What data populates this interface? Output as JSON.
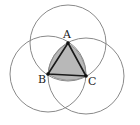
{
  "diagram": {
    "points": [
      {
        "label": "A",
        "x": 68,
        "y": 43
      },
      {
        "label": "B",
        "x": 48,
        "y": 74
      },
      {
        "label": "C",
        "x": 86,
        "y": 76
      }
    ],
    "radius": 38,
    "colors": {
      "circle_stroke": "#8a8a8a",
      "fill": "#b8b8b8",
      "triangle_stroke": "#1a1a1a",
      "point": "#111111"
    }
  }
}
